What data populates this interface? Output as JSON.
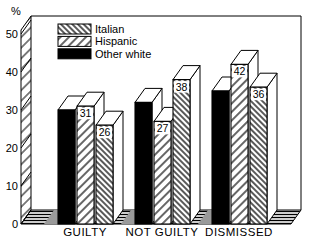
{
  "figure": {
    "background": "#ffffff",
    "ink": "#000000",
    "shadow_color": "#9a9a9a"
  },
  "chart_data": {
    "type": "bar",
    "style": "3d-perspective-monochrome-hatched",
    "title": "",
    "xlabel": "",
    "ylabel": "%",
    "ylim": [
      0,
      50
    ],
    "yticks": [
      0,
      10,
      20,
      30,
      40,
      50
    ],
    "grid": false,
    "legend_position": "top-left",
    "categories": [
      "GUILTY",
      "NOT GUILTY",
      "DISMISSED"
    ],
    "series": [
      {
        "name": "Italian",
        "swatch": "backslash-hatch",
        "values": [
          26,
          38,
          36
        ]
      },
      {
        "name": "Hispanic",
        "swatch": "slash-hatch",
        "values": [
          31,
          27,
          42
        ]
      },
      {
        "name": "Other white",
        "swatch": "solid-black",
        "values": [
          30,
          32,
          35
        ]
      }
    ],
    "bar_order_left_to_right": [
      "Other white",
      "Hispanic",
      "Italian"
    ],
    "bar_value_labels_shown": true
  }
}
